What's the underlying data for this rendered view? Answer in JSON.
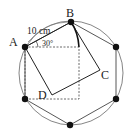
{
  "diagram": {
    "labels": {
      "A": "A",
      "B": "B",
      "C": "C",
      "D": "D",
      "length": "10 cm",
      "angle": "30°"
    },
    "colors": {
      "stroke": "#222222",
      "circle": "#777777",
      "background": "#ffffff"
    }
  }
}
